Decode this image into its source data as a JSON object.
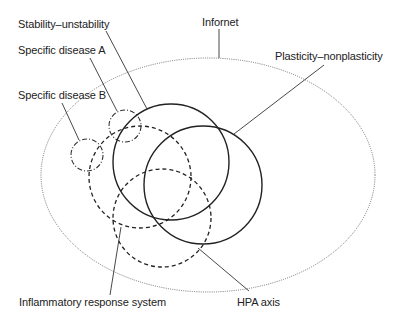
{
  "diagram": {
    "labels": {
      "stability": "Stability–unstability",
      "disease_a": "Specific disease A",
      "disease_b": "Specific disease B",
      "infornet": "Infornet",
      "plasticity": "Plasticity–nonplasticity",
      "inflammatory": "Inflammatory response system",
      "hpa": "HPA axis"
    },
    "shapes": {
      "infornet": {
        "type": "ellipse",
        "style": "dotted",
        "cx": 208,
        "cy": 175,
        "rx": 167,
        "ry": 117
      },
      "stability": {
        "type": "circle",
        "style": "solid",
        "cx": 171,
        "cy": 162,
        "r": 58
      },
      "plasticity": {
        "type": "circle",
        "style": "solid",
        "cx": 203,
        "cy": 185,
        "r": 59
      },
      "hpa_axis": {
        "type": "circle",
        "style": "dashed",
        "cx": 140,
        "cy": 177,
        "r": 51
      },
      "inflammatory": {
        "type": "circle",
        "style": "dashed",
        "cx": 162,
        "cy": 218,
        "r": 49
      },
      "disease_a": {
        "type": "circle",
        "style": "dash-dot",
        "cx": 125,
        "cy": 126,
        "r": 16
      },
      "disease_b": {
        "type": "circle",
        "style": "dash-dot",
        "cx": 87,
        "cy": 155,
        "r": 16
      }
    },
    "colors": {
      "line": "#222222",
      "dotted": "#555555",
      "text": "#222222"
    }
  }
}
